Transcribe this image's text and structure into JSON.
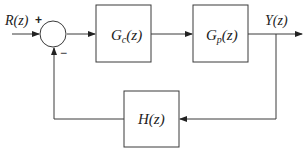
{
  "diagram": {
    "type": "feedback-control-block-diagram",
    "input_label": "R(z)",
    "output_label": "Y(z)",
    "summing_junction": {
      "plus_sign": "+",
      "minus_sign": "−"
    },
    "blocks": [
      {
        "id": "controller",
        "label_main": "G",
        "label_sub": "c",
        "label_arg": "(z)"
      },
      {
        "id": "plant",
        "label_main": "G",
        "label_sub": "p",
        "label_arg": "(z)"
      },
      {
        "id": "feedback",
        "label_main": "H",
        "label_sub": "",
        "label_arg": "(z)"
      }
    ],
    "colors": {
      "line": "#3a3a3a",
      "background": "#ffffff"
    }
  }
}
